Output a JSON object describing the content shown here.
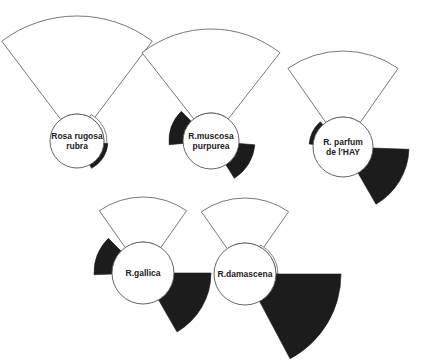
{
  "colors": {
    "outline": "#555555",
    "dark": "#1c1c1c",
    "background": "#ffffff"
  },
  "diagrams": [
    {
      "name": "rosa-rugosa-rubra",
      "label_lines": [
        "Rosa rugosa",
        "rubra"
      ],
      "cx": 77,
      "cy": 141,
      "r": 27,
      "sectors": [
        {
          "type": "white",
          "start": -37,
          "end": 37,
          "outer": 125
        },
        {
          "type": "thin-white",
          "start": 28,
          "end": 95,
          "outer": 30
        },
        {
          "type": "dark",
          "start": 95,
          "end": 152,
          "outer": 31
        }
      ]
    },
    {
      "name": "r-muscosa-purpurea",
      "label_lines": [
        "R.muscosa",
        "purpurea"
      ],
      "cx": 211,
      "cy": 141,
      "r": 28,
      "sectors": [
        {
          "type": "white",
          "start": -38,
          "end": 38,
          "outer": 112
        },
        {
          "type": "dark",
          "start": -95,
          "end": -45,
          "outer": 42
        },
        {
          "type": "dark",
          "start": 95,
          "end": 148,
          "outer": 44
        }
      ]
    },
    {
      "name": "r-parfum-de-lhay",
      "label_lines": [
        "R.  parfum",
        "de l'HAY"
      ],
      "cx": 343,
      "cy": 147,
      "r": 30,
      "sectors": [
        {
          "type": "white",
          "start": -35,
          "end": 35,
          "outer": 96
        },
        {
          "type": "dark",
          "start": -85,
          "end": -42,
          "outer": 34
        },
        {
          "type": "dark",
          "start": 92,
          "end": 150,
          "outer": 66
        }
      ]
    },
    {
      "name": "r-gallica",
      "label_lines": [
        "R.gallica"
      ],
      "cx": 143,
      "cy": 273,
      "r": 31,
      "sectors": [
        {
          "type": "white",
          "start": -35,
          "end": 35,
          "outer": 76
        },
        {
          "type": "dark",
          "start": -92,
          "end": -45,
          "outer": 49
        },
        {
          "type": "dark",
          "start": 90,
          "end": 150,
          "outer": 68
        }
      ]
    },
    {
      "name": "r-damascena",
      "label_lines": [
        "R.damascena"
      ],
      "cx": 245,
      "cy": 274,
      "r": 31,
      "sectors": [
        {
          "type": "white",
          "start": -35,
          "end": 35,
          "outer": 76
        },
        {
          "type": "thin-white",
          "start": 28,
          "end": 90,
          "outer": 33
        },
        {
          "type": "dark",
          "start": 90,
          "end": 152,
          "outer": 96
        }
      ]
    }
  ]
}
